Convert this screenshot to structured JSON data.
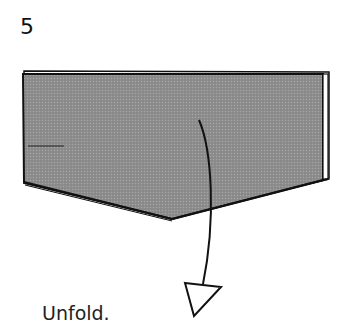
{
  "step": {
    "number": "5"
  },
  "caption": {
    "text": "Unfold."
  },
  "diagram": {
    "paper_fill": "#8f8f8f",
    "outline_color": "#111111",
    "arrow": {
      "type": "unfold-arrow",
      "direction": "down"
    },
    "crease_mark": "short horizontal line at left edge"
  }
}
